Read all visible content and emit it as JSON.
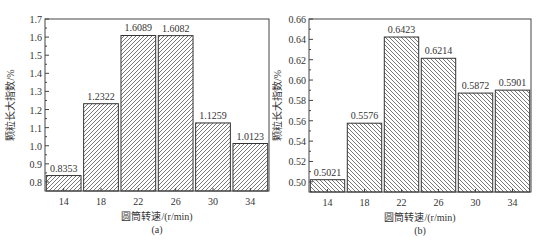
{
  "chart_data": [
    {
      "type": "bar",
      "panel_label": "(a)",
      "title": "",
      "xlabel": "圆筒转速/(r/min)",
      "ylabel": "颗粒长大指数/%",
      "categories": [
        "14",
        "18",
        "22",
        "26",
        "30",
        "34"
      ],
      "values": [
        0.8353,
        1.2322,
        1.6089,
        1.6082,
        1.1259,
        1.0123
      ],
      "data_labels": [
        "0.8353",
        "1.2322",
        "1.6089",
        "1.6082",
        "1.1259",
        "1.0123"
      ],
      "ylim": [
        0.75,
        1.7
      ],
      "yticks": [
        0.8,
        0.9,
        1.0,
        1.1,
        1.2,
        1.3,
        1.4,
        1.5,
        1.6,
        1.7
      ],
      "ytick_labels": [
        "0.8",
        "0.9",
        "1.0",
        "1.1",
        "1.2",
        "1.3",
        "1.4",
        "1.5",
        "1.6",
        "1.7"
      ],
      "hatch": "forward-diagonal",
      "grid": false,
      "legend": null
    },
    {
      "type": "bar",
      "panel_label": "(b)",
      "title": "",
      "xlabel": "圆筒转速/(r/min)",
      "ylabel": "颗粒长大指数/%",
      "categories": [
        "14",
        "18",
        "22",
        "26",
        "30",
        "34"
      ],
      "values": [
        0.5021,
        0.5576,
        0.6423,
        0.6214,
        0.5872,
        0.5901
      ],
      "data_labels": [
        "0.5021",
        "0.5576",
        "0.6423",
        "0.6214",
        "0.5872",
        "0.5901"
      ],
      "ylim": [
        0.49,
        0.66
      ],
      "yticks": [
        0.5,
        0.52,
        0.54,
        0.56,
        0.58,
        0.6,
        0.62,
        0.64,
        0.66
      ],
      "ytick_labels": [
        "0.50",
        "0.52",
        "0.54",
        "0.56",
        "0.58",
        "0.60",
        "0.62",
        "0.64",
        "0.66"
      ],
      "hatch": "backward-diagonal",
      "grid": false,
      "legend": null
    }
  ],
  "style": {
    "axis_color": "#444444",
    "bar_edge_color": "#333333",
    "hatch_color": "#555555",
    "text_color": "#333333"
  }
}
